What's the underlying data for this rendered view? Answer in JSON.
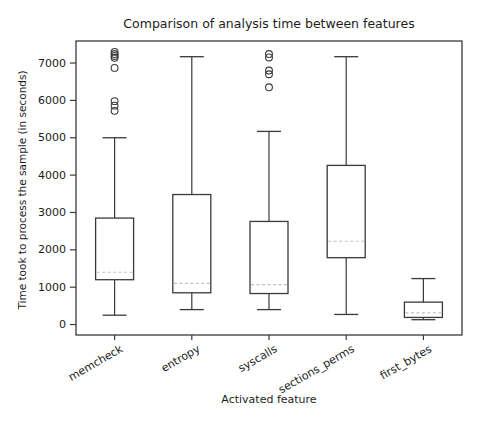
{
  "chart_data": {
    "type": "boxplot",
    "title": "Comparison of analysis time between features",
    "xlabel": "Activated feature",
    "ylabel": "Time took to process the sample (in seconds)",
    "categories": [
      "memcheck",
      "entropy",
      "syscalls",
      "sections_perms",
      "first_bytes"
    ],
    "yticks": [
      0,
      1000,
      2000,
      3000,
      4000,
      5000,
      6000,
      7000
    ],
    "ylim": [
      -280,
      7590
    ],
    "grid": false,
    "legend": "none",
    "x_tick_rotation_deg": 30,
    "boxes": [
      {
        "category": "memcheck",
        "whisker_low": 250,
        "q1": 1200,
        "median": 1400,
        "q3": 2850,
        "whisker_high": 5000,
        "outliers": [
          5720,
          5860,
          5980,
          6870,
          7140,
          7190,
          7240,
          7300
        ]
      },
      {
        "category": "entropy",
        "whisker_low": 400,
        "q1": 850,
        "median": 1100,
        "q3": 3480,
        "whisker_high": 7170,
        "outliers": []
      },
      {
        "category": "syscalls",
        "whisker_low": 400,
        "q1": 830,
        "median": 1070,
        "q3": 2760,
        "whisker_high": 5170,
        "outliers": [
          6350,
          6700,
          6800,
          7150,
          7240
        ]
      },
      {
        "category": "sections_perms",
        "whisker_low": 270,
        "q1": 1790,
        "median": 2230,
        "q3": 4260,
        "whisker_high": 7170,
        "outliers": []
      },
      {
        "category": "first_bytes",
        "whisker_low": 130,
        "q1": 190,
        "median": 310,
        "q3": 600,
        "whisker_high": 1230,
        "outliers": []
      }
    ],
    "colors": {
      "line": "#3a3a3a",
      "median": "#c2c2c2",
      "text": "#1c1c1c",
      "background": "#ffffff"
    }
  }
}
